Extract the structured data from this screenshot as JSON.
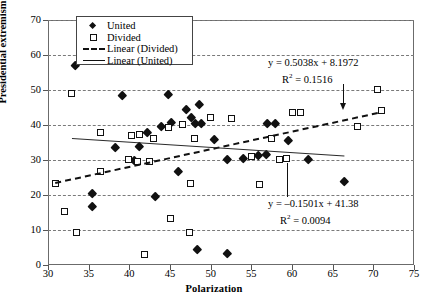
{
  "chart_data": {
    "type": "scatter",
    "title": "",
    "xlabel": "Polarization",
    "ylabel": "Presidential extremism",
    "xlim": [
      30,
      75
    ],
    "ylim": [
      0,
      70
    ],
    "xticks": [
      30,
      35,
      40,
      45,
      50,
      55,
      60,
      65,
      70,
      75
    ],
    "yticks": [
      0,
      10,
      20,
      30,
      40,
      50,
      60,
      70
    ],
    "grid": "horizontal-dashed",
    "legend_position": "top-left-inside",
    "legend": [
      {
        "label": "United",
        "marker": "filled-diamond"
      },
      {
        "label": "Divided",
        "marker": "open-square"
      },
      {
        "label": "Linear (Divided)",
        "marker": "dashed-line"
      },
      {
        "label": "Linear (United)",
        "marker": "solid-line"
      }
    ],
    "series": [
      {
        "name": "United",
        "marker": "filled-diamond",
        "points": [
          [
            33.4,
            57.2
          ],
          [
            39.1,
            48.6
          ],
          [
            44.8,
            48.7
          ],
          [
            47.0,
            44.6
          ],
          [
            48.6,
            45.8
          ],
          [
            45.2,
            40.9
          ],
          [
            43.9,
            39.6
          ],
          [
            47.6,
            42.1
          ],
          [
            48.1,
            40.4
          ],
          [
            48.8,
            40.4
          ],
          [
            42.2,
            38.0
          ],
          [
            41.2,
            33.9
          ],
          [
            38.3,
            33.5
          ],
          [
            40.6,
            30.0
          ],
          [
            52.0,
            30.3
          ],
          [
            54.0,
            30.4
          ],
          [
            55.9,
            31.4
          ],
          [
            56.9,
            31.5
          ],
          [
            62.0,
            30.2
          ],
          [
            46.0,
            26.7
          ],
          [
            43.2,
            19.6
          ],
          [
            66.4,
            23.8
          ],
          [
            35.4,
            20.5
          ],
          [
            35.5,
            16.9
          ],
          [
            48.4,
            4.4
          ],
          [
            52.0,
            3.4
          ],
          [
            58.0,
            40.6
          ],
          [
            57.0,
            40.5
          ],
          [
            50.5,
            36.0
          ],
          [
            59.5,
            35.5
          ]
        ]
      },
      {
        "name": "Divided",
        "marker": "open-square",
        "points": [
          [
            32.9,
            49.1
          ],
          [
            70.5,
            50.2
          ],
          [
            71.0,
            44.3
          ],
          [
            60.0,
            43.6
          ],
          [
            61.0,
            43.7
          ],
          [
            50.0,
            42.1
          ],
          [
            52.5,
            41.9
          ],
          [
            46.5,
            40.2
          ],
          [
            44.8,
            39.4
          ],
          [
            68.0,
            39.5
          ],
          [
            36.5,
            37.9
          ],
          [
            40.3,
            37.0
          ],
          [
            41.2,
            37.4
          ],
          [
            43.0,
            36.2
          ],
          [
            48.0,
            36.3
          ],
          [
            57.5,
            36.1
          ],
          [
            39.9,
            30.2
          ],
          [
            41.0,
            29.6
          ],
          [
            36.4,
            26.7
          ],
          [
            30.9,
            23.3
          ],
          [
            47.5,
            23.3
          ],
          [
            56.0,
            22.9
          ],
          [
            32.0,
            15.4
          ],
          [
            45.0,
            13.4
          ],
          [
            33.5,
            9.2
          ],
          [
            47.4,
            9.3
          ],
          [
            41.9,
            3.1
          ],
          [
            55.0,
            31.0
          ],
          [
            58.5,
            30.2
          ],
          [
            59.3,
            30.4
          ],
          [
            42.5,
            29.7
          ]
        ]
      }
    ],
    "trendlines": [
      {
        "name": "Linear (Divided)",
        "style": "dashed",
        "slope": 0.5038,
        "intercept": 8.1972,
        "r2": 0.1516,
        "equation": "y = 0.5038x + 8.1972",
        "r2_text": "R",
        "r2_sup": "2",
        "r2_value": " = 0.1516",
        "x_range": [
          30.8,
          70.5
        ]
      },
      {
        "name": "Linear (United)",
        "style": "solid",
        "slope": -0.1501,
        "intercept": 41.38,
        "r2": 0.0094,
        "equation": "y = –0.1501x + 41.38",
        "r2_text": "R",
        "r2_sup": "2",
        "r2_value": " = 0.0094",
        "x_range": [
          33.0,
          66.5
        ]
      }
    ],
    "annotations": [
      {
        "name": "divided-equation",
        "line1": "y = 0.5038x + 8.1972",
        "r2_label": "R",
        "r2_exp": "2",
        "r2_rest": " = 0.1516"
      },
      {
        "name": "united-equation",
        "line1": "y = –0.1501x + 41.38",
        "r2_label": "R",
        "r2_exp": "2",
        "r2_rest": " = 0.0094"
      }
    ]
  }
}
